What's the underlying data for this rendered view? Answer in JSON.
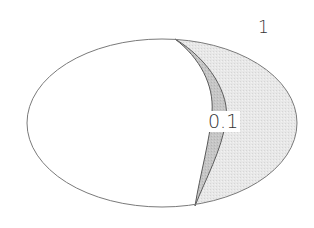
{
  "diagram": {
    "type": "ellipse-contour-regions",
    "labels": {
      "outer_region": "1",
      "inner_region": "0.1"
    },
    "colors": {
      "background": "#ffffff",
      "ellipse_fill": "#ffffff",
      "outline": "#7a7a7a",
      "region_light": "#e6e6e6",
      "region_dark": "#c4c4c4"
    }
  }
}
